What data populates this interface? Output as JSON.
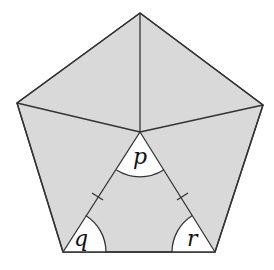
{
  "diagram": {
    "type": "regular pentagon divided into five triangles from an interior point",
    "fill_color": "#d9d9d9",
    "line_color": "#333333",
    "angle_labels": {
      "apex": "p",
      "bottom_left": "q",
      "bottom_right": "r"
    },
    "equal_side_marks": 2
  }
}
